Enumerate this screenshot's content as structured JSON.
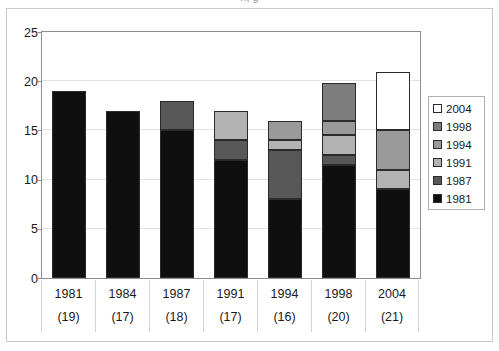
{
  "figure": {
    "title_sliver": "n, g",
    "background": "#ffffff"
  },
  "chart_data": {
    "type": "bar",
    "subtype": "stacked-bar",
    "title": "",
    "xlabel": "",
    "ylabel": "",
    "ylim": [
      0,
      25
    ],
    "yticks": [
      0,
      5,
      10,
      15,
      20,
      25
    ],
    "ytick_labels": [
      "0",
      "5",
      "10",
      "15",
      "20",
      "25"
    ],
    "grid": true,
    "legend_position": "right",
    "categories": [
      "1981",
      "1984",
      "1987",
      "1991",
      "1994",
      "1998",
      "2004"
    ],
    "category_sublabels": [
      "(19)",
      "(17)",
      "(18)",
      "(17)",
      "(16)",
      "(20)",
      "(21)"
    ],
    "totals": [
      19,
      17,
      18,
      17,
      16,
      19.8,
      20.9
    ],
    "series": [
      {
        "name": "1981",
        "color": "#100f0f",
        "values": [
          19,
          17,
          15,
          12,
          8,
          11.5,
          9
        ]
      },
      {
        "name": "1987",
        "color": "#585858",
        "values": [
          0,
          0,
          3,
          2,
          5,
          1,
          0
        ]
      },
      {
        "name": "1991",
        "color": "#b3b3b3",
        "values": [
          0,
          0,
          0,
          3,
          1,
          2,
          2
        ]
      },
      {
        "name": "1994",
        "color": "#9a9a9a",
        "values": [
          0,
          0,
          0,
          0,
          2,
          1.5,
          4
        ]
      },
      {
        "name": "1998",
        "color": "#7d7d7d",
        "values": [
          0,
          0,
          0,
          0,
          0,
          3.8,
          0
        ]
      },
      {
        "name": "2004",
        "color": "#ffffff",
        "values": [
          0,
          0,
          0,
          0,
          0,
          0,
          5.9
        ]
      }
    ],
    "legend_entries": [
      {
        "label": "2004",
        "color": "#ffffff"
      },
      {
        "label": "1998",
        "color": "#7d7d7d"
      },
      {
        "label": "1994",
        "color": "#9a9a9a"
      },
      {
        "label": "1991",
        "color": "#b3b3b3"
      },
      {
        "label": "1987",
        "color": "#585858"
      },
      {
        "label": "1981",
        "color": "#100f0f"
      }
    ]
  }
}
